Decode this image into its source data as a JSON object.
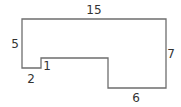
{
  "diagram": {
    "type": "rectilinear-polygon",
    "stroke_color": "#6e6e6e",
    "label_color": "#333333",
    "vertices": [
      [
        22,
        19
      ],
      [
        166,
        19
      ],
      [
        166,
        88
      ],
      [
        108,
        88
      ],
      [
        108,
        58
      ],
      [
        41,
        58
      ],
      [
        41,
        68
      ],
      [
        22,
        68
      ]
    ],
    "labels": {
      "top": "15",
      "right": "7",
      "bottom_right": "6",
      "left": "5",
      "bottom_left": "2",
      "notch": "1"
    }
  }
}
